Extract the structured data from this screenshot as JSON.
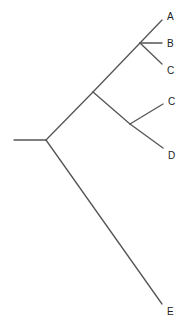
{
  "diagram": {
    "type": "phylogenetic-tree",
    "line_color": "#555555",
    "text_color": "#222222",
    "background": "#ffffff",
    "leaves": [
      {
        "label": "A"
      },
      {
        "label": "B"
      },
      {
        "label": "C"
      },
      {
        "label": "C"
      },
      {
        "label": "D"
      },
      {
        "label": "E"
      }
    ],
    "topology": "((A,B,C),(C,D)),E"
  }
}
